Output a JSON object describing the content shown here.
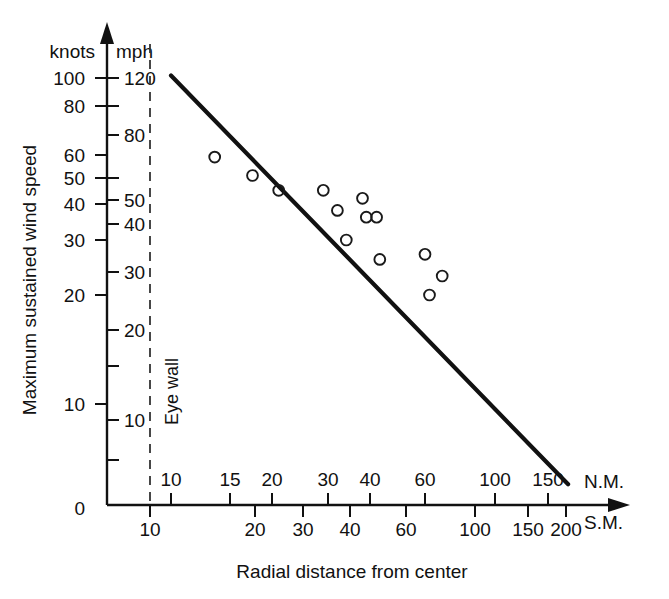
{
  "chart_data": {
    "type": "scatter",
    "title": "",
    "xlabel": "Radial distance from center",
    "ylabel": "Maximum sustained wind speed",
    "x_unit_primary": "N.M.",
    "x_unit_secondary": "S.M.",
    "y_unit_primary": "knots",
    "y_unit_secondary": "mph",
    "x_scale": "log",
    "y_scale": "log",
    "xlim_nm": [
      8.8,
      175
    ],
    "ylim_knots": [
      0,
      115
    ],
    "grid": false,
    "legend": null,
    "annotations": [
      {
        "text": "Eye wall",
        "x_nm": 10,
        "orientation": "vertical",
        "style": "dashed-line"
      }
    ],
    "x_ticks_nm": [
      "10",
      "15",
      "20",
      "30",
      "40",
      "60",
      "100",
      "150"
    ],
    "x_ticks_sm": [
      "10",
      "20",
      "30",
      "40",
      "60",
      "100",
      "150",
      "200"
    ],
    "y_ticks_knots": [
      "100",
      "80",
      "60",
      "50",
      "40",
      "30",
      "20",
      "10",
      "0"
    ],
    "y_ticks_mph": [
      "120",
      "80",
      "50",
      "40",
      "30",
      "20",
      "10"
    ],
    "series": [
      {
        "name": "Observations",
        "marker": "open-circle",
        "points": [
          {
            "x_nm": 13.5,
            "y_knots": 59
          },
          {
            "x_nm": 17.5,
            "y_knots": 51
          },
          {
            "x_nm": 21,
            "y_knots": 45
          },
          {
            "x_nm": 29,
            "y_knots": 45
          },
          {
            "x_nm": 32,
            "y_knots": 38
          },
          {
            "x_nm": 38,
            "y_knots": 42
          },
          {
            "x_nm": 34,
            "y_knots": 30
          },
          {
            "x_nm": 39,
            "y_knots": 36
          },
          {
            "x_nm": 42,
            "y_knots": 36
          },
          {
            "x_nm": 43,
            "y_knots": 26
          },
          {
            "x_nm": 60,
            "y_knots": 27
          },
          {
            "x_nm": 68,
            "y_knots": 23
          },
          {
            "x_nm": 62,
            "y_knots": 20
          }
        ]
      }
    ],
    "trend_line": {
      "label": "",
      "start": {
        "x_nm": 10,
        "y_knots": 102
      },
      "end": {
        "x_nm": 175,
        "y_knots": 6
      }
    }
  },
  "axes": {
    "y": {
      "label": "Maximum sustained wind speed",
      "unit_left_header": "knots",
      "unit_right_header": "mph",
      "ticks_left": [
        {
          "label": "100",
          "y_px": 78
        },
        {
          "label": "80",
          "y_px": 106
        },
        {
          "label": "60",
          "y_px": 155
        },
        {
          "label": "50",
          "y_px": 178
        },
        {
          "label": "40",
          "y_px": 204
        },
        {
          "label": "30",
          "y_px": 240
        },
        {
          "label": "20",
          "y_px": 295
        },
        {
          "label": "10",
          "y_px": 404
        },
        {
          "label": "0",
          "y_px": 508
        }
      ],
      "ticks_right": [
        {
          "label": "120",
          "y_px": 78
        },
        {
          "label": "80",
          "y_px": 135
        },
        {
          "label": "50",
          "y_px": 200
        },
        {
          "label": "40",
          "y_px": 224
        },
        {
          "label": "30",
          "y_px": 272
        },
        {
          "label": "20",
          "y_px": 330
        },
        {
          "label": "10",
          "y_px": 420
        }
      ],
      "minor_ticks_px": [
        106,
        135,
        178,
        200,
        224,
        272,
        330,
        366,
        420,
        460
      ]
    },
    "x": {
      "label": "Radial distance from center",
      "unit_upper": "N.M.",
      "unit_lower": "S.M.",
      "ticks_upper": [
        {
          "label": "10",
          "x_px": 171
        },
        {
          "label": "15",
          "x_px": 230
        },
        {
          "label": "20",
          "x_px": 272
        },
        {
          "label": "30",
          "x_px": 328
        },
        {
          "label": "40",
          "x_px": 370
        },
        {
          "label": "60",
          "x_px": 425
        },
        {
          "label": "100",
          "x_px": 495
        },
        {
          "label": "150",
          "x_px": 548
        }
      ],
      "ticks_lower": [
        {
          "label": "10",
          "x_px": 150
        },
        {
          "label": "20",
          "x_px": 255
        },
        {
          "label": "30",
          "x_px": 303
        },
        {
          "label": "40",
          "x_px": 350
        },
        {
          "label": "60",
          "x_px": 406
        },
        {
          "label": "100",
          "x_px": 475
        },
        {
          "label": "150",
          "x_px": 528
        },
        {
          "label": "200",
          "x_px": 566
        }
      ]
    }
  },
  "annotation": {
    "eye_wall": "Eye wall"
  }
}
